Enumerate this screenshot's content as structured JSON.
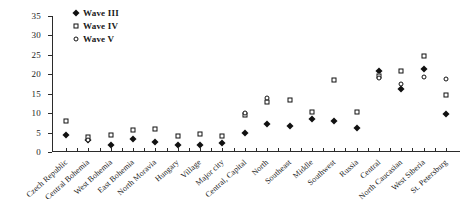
{
  "chart_data": {
    "type": "scatter",
    "title": "",
    "xlabel": "",
    "ylabel": "",
    "ylim": [
      0,
      35
    ],
    "ytick_values": [
      0,
      5,
      10,
      15,
      20,
      25,
      30,
      35
    ],
    "ytick_labels": [
      "0",
      "5",
      "10",
      "15",
      "20",
      "25",
      "30",
      "35"
    ],
    "grid": false,
    "legend_position": "top-left",
    "categories": [
      "Czech Republic",
      "Central Bohemia",
      "West Bohemia",
      "East Bohemia",
      "North Moravia",
      "Hungary",
      "Village",
      "Major city",
      "Central, Capital",
      "North",
      "Southeast",
      "Middle",
      "Southwest",
      "Russia",
      "Central",
      "North Caucasian",
      "West Siberia",
      "St. Petersburg"
    ],
    "series": [
      {
        "name": "Wave III",
        "marker": "filled-diamond",
        "color": "#111111",
        "values": [
          4.5,
          3.1,
          1.9,
          3.3,
          2.6,
          1.7,
          1.8,
          2.3,
          5.0,
          7.2,
          6.6,
          8.6,
          8.0,
          6.2,
          20.8,
          16.3,
          21.3,
          9.8
        ]
      },
      {
        "name": "Wave IV",
        "marker": "open-square",
        "color": "#111111",
        "values": [
          8.0,
          3.8,
          4.5,
          5.7,
          6.0,
          4.2,
          4.7,
          4.2,
          9.5,
          12.9,
          13.5,
          10.4,
          18.5,
          10.3,
          19.6,
          20.8,
          24.6,
          14.6
        ]
      },
      {
        "name": "Wave V",
        "marker": "open-circle",
        "color": "#111111",
        "values": [
          null,
          3.2,
          null,
          null,
          null,
          null,
          10.1,
          13.9,
          8.5,
          7.5,
          8.0,
          8.2,
          9.1,
          7.1,
          19.0,
          17.6,
          19.4,
          18.9
        ]
      }
    ],
    "legend": [
      {
        "label": "Wave III",
        "marker": "filled-diamond"
      },
      {
        "label": "Wave IV",
        "marker": "open-square"
      },
      {
        "label": "Wave V",
        "marker": "open-circle"
      }
    ],
    "points": [
      {
        "x": 0,
        "series": "Wave III",
        "value": 4.5
      },
      {
        "x": 0,
        "series": "Wave IV",
        "value": 8.0
      },
      {
        "x": 1,
        "series": "Wave III",
        "value": 3.1
      },
      {
        "x": 1,
        "series": "Wave IV",
        "value": 3.8
      },
      {
        "x": 1,
        "series": "Wave V",
        "value": 3.2
      },
      {
        "x": 2,
        "series": "Wave III",
        "value": 1.9
      },
      {
        "x": 2,
        "series": "Wave IV",
        "value": 4.5
      },
      {
        "x": 3,
        "series": "Wave III",
        "value": 3.3
      },
      {
        "x": 3,
        "series": "Wave IV",
        "value": 5.7
      },
      {
        "x": 4,
        "series": "Wave III",
        "value": 2.6
      },
      {
        "x": 4,
        "series": "Wave IV",
        "value": 6.0
      },
      {
        "x": 5,
        "series": "Wave III",
        "value": 1.7
      },
      {
        "x": 5,
        "series": "Wave IV",
        "value": 4.2
      },
      {
        "x": 6,
        "series": "Wave III",
        "value": 1.8
      },
      {
        "x": 6,
        "series": "Wave IV",
        "value": 4.7
      },
      {
        "x": 7,
        "series": "Wave III",
        "value": 2.3
      },
      {
        "x": 7,
        "series": "Wave IV",
        "value": 4.2
      },
      {
        "x": 8,
        "series": "Wave III",
        "value": 5.0
      },
      {
        "x": 8,
        "series": "Wave IV",
        "value": 9.5
      },
      {
        "x": 8,
        "series": "Wave V",
        "value": 10.1
      },
      {
        "x": 9,
        "series": "Wave III",
        "value": 7.2
      },
      {
        "x": 9,
        "series": "Wave IV",
        "value": 12.9
      },
      {
        "x": 9,
        "series": "Wave V",
        "value": 13.9
      },
      {
        "x": 10,
        "series": "Wave III",
        "value": 6.6
      },
      {
        "x": 10,
        "series": "Wave IV",
        "value": 13.5
      },
      {
        "x": 11,
        "series": "Wave III",
        "value": 8.6
      },
      {
        "x": 11,
        "series": "Wave IV",
        "value": 10.4
      },
      {
        "x": 12,
        "series": "Wave III",
        "value": 8.0
      },
      {
        "x": 12,
        "series": "Wave IV",
        "value": 18.5
      },
      {
        "x": 13,
        "series": "Wave III",
        "value": 6.2
      },
      {
        "x": 13,
        "series": "Wave IV",
        "value": 10.3
      },
      {
        "x": 14,
        "series": "Wave III",
        "value": 20.8
      },
      {
        "x": 14,
        "series": "Wave IV",
        "value": 19.6
      },
      {
        "x": 14,
        "series": "Wave V",
        "value": 19.0
      },
      {
        "x": 15,
        "series": "Wave III",
        "value": 16.3
      },
      {
        "x": 15,
        "series": "Wave IV",
        "value": 20.8
      },
      {
        "x": 15,
        "series": "Wave V",
        "value": 17.6
      },
      {
        "x": 16,
        "series": "Wave III",
        "value": 21.3
      },
      {
        "x": 16,
        "series": "Wave IV",
        "value": 24.6
      },
      {
        "x": 16,
        "series": "Wave V",
        "value": 19.4
      },
      {
        "x": 17,
        "series": "Wave III",
        "value": 9.8
      },
      {
        "x": 17,
        "series": "Wave IV",
        "value": 14.6
      },
      {
        "x": 17,
        "series": "Wave V",
        "value": 18.9
      }
    ]
  }
}
